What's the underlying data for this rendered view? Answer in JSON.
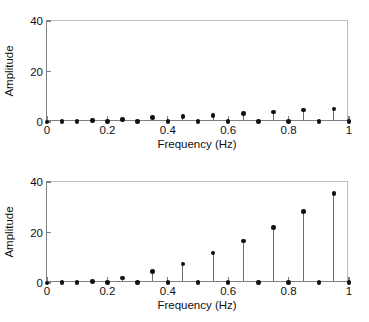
{
  "chart_data": [
    {
      "id": "top",
      "type": "scatter",
      "style": "stem",
      "title": "",
      "xlabel": "Frequency (Hz)",
      "ylabel": "Amplitude",
      "xlim": [
        0,
        1
      ],
      "ylim": [
        0,
        40
      ],
      "xticks": [
        0,
        0.2,
        0.4,
        0.6,
        0.8,
        1
      ],
      "xticklabels": [
        "0",
        "0.2",
        "0.4",
        "0.6",
        "0.8",
        "1"
      ],
      "yticks": [
        0,
        20,
        40
      ],
      "yticklabels": [
        "0",
        "20",
        "40"
      ],
      "grid": false,
      "legend": null,
      "marker": "filled-circle",
      "x": [
        0,
        0.05,
        0.1,
        0.15,
        0.2,
        0.25,
        0.3,
        0.35,
        0.4,
        0.45,
        0.5,
        0.55,
        0.6,
        0.65,
        0.7,
        0.75,
        0.8,
        0.85,
        0.9,
        0.95,
        1
      ],
      "values": [
        0,
        0.2,
        0.2,
        0.6,
        0.2,
        1.1,
        0.2,
        1.7,
        0.3,
        2.2,
        0.2,
        2.6,
        0.2,
        3.3,
        0.2,
        3.9,
        0.2,
        4.7,
        0.2,
        5.2,
        0.2
      ]
    },
    {
      "id": "bottom",
      "type": "scatter",
      "style": "stem",
      "title": "",
      "xlabel": "Frequency (Hz)",
      "ylabel": "Amplitude",
      "xlim": [
        0,
        1
      ],
      "ylim": [
        0,
        40
      ],
      "xticks": [
        0,
        0.2,
        0.4,
        0.6,
        0.8,
        1
      ],
      "xticklabels": [
        "0",
        "0.2",
        "0.4",
        "0.6",
        "0.8",
        "1"
      ],
      "yticks": [
        0,
        20,
        40
      ],
      "yticklabels": [
        "0",
        "20",
        "40"
      ],
      "grid": false,
      "legend": null,
      "marker": "filled-circle",
      "x": [
        0,
        0.05,
        0.1,
        0.15,
        0.2,
        0.25,
        0.3,
        0.35,
        0.4,
        0.45,
        0.5,
        0.55,
        0.6,
        0.65,
        0.7,
        0.75,
        0.8,
        0.85,
        0.9,
        0.95,
        1
      ],
      "values": [
        0,
        0.2,
        0.2,
        0.6,
        0.2,
        2.0,
        0.2,
        4.5,
        0.2,
        7.6,
        0.2,
        11.8,
        0.2,
        16.6,
        0.2,
        22.0,
        0.2,
        28.2,
        0.2,
        35.4,
        0.2
      ]
    }
  ],
  "axes": {
    "xlabel": "Frequency (Hz)",
    "ylabel": "Amplitude"
  },
  "colors": {
    "marker": "#111111",
    "stem": "#6e6e6e",
    "axis": "#808080",
    "background": "#ffffff"
  }
}
